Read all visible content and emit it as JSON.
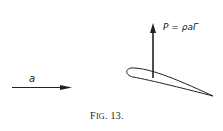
{
  "figure": {
    "caption_prefix": "F",
    "caption_smallcaps": "IG",
    "caption_suffix": ". 13.",
    "velocity_label": "a",
    "lift_label": "P = ρaΓ",
    "stroke_color": "#222222"
  }
}
